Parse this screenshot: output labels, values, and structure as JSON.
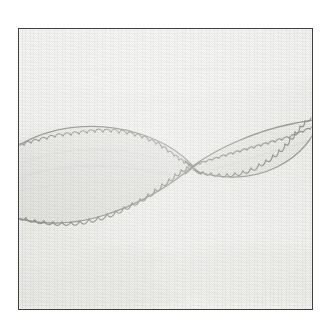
{
  "image": {
    "kind": "photograph",
    "subject": "hand-embroidered leaf motif on plain woven fabric",
    "caption": "",
    "frame": {
      "left": 18,
      "top": 28,
      "width": 295,
      "height": 282,
      "border_color": "#3e3e3e",
      "border_width": 1
    },
    "page_background": "#ffffff"
  },
  "palette": {
    "page": "#ffffff",
    "fabric_light": "#f5f5f3",
    "fabric_mid": "#eeeeec",
    "fabric_shadow": "#e2e2df",
    "motif_fill": "#e3e3e0",
    "motif_fill_deep": "#d8d8d4",
    "stitch_thread": "#9a9a95",
    "stitch_thread_dark": "#7e7e79",
    "frame_border": "#3e3e3e"
  },
  "motif": {
    "name": "double-leaf-scallop-embroidery",
    "description": "Two elongated pointed-oval leaf shapes meeting at a single crossing point near the centre of the cloth; each outline is worked in a looped scallop (blanket) stitch.",
    "crossing_point": {
      "x": 172,
      "y": 136
    },
    "leaves": [
      {
        "id": "left-leaf",
        "label": "left leaf",
        "orientation": "descending to the right",
        "tip_left": {
          "x": -2,
          "y": 120
        },
        "tip_right": {
          "x": 172,
          "y": 136
        },
        "widest_height": 78,
        "scallop_count_top": 34,
        "scallop_count_bottom": 30
      },
      {
        "id": "right-leaf",
        "label": "right leaf",
        "orientation": "ascending to the right",
        "tip_left": {
          "x": 172,
          "y": 136
        },
        "tip_right": {
          "x": 298,
          "y": 100
        },
        "widest_height": 44,
        "scallop_count_top": 26,
        "scallop_count_bottom": 24
      }
    ],
    "stitch_style": "looped scallop / blanket stitch",
    "thread_color": "#9a9a95"
  }
}
